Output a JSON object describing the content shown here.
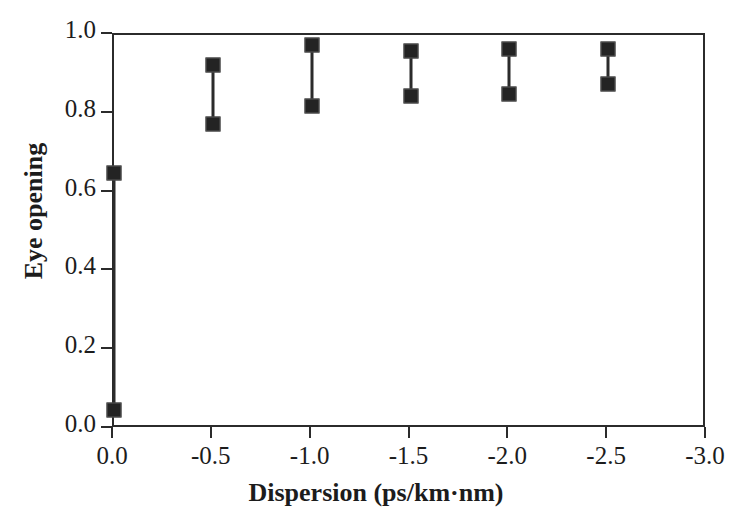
{
  "chart_data": {
    "type": "scatter",
    "title": "",
    "xlabel": "Dispersion (ps/km·nm)",
    "ylabel": "Eye opening",
    "xlim": [
      0.0,
      -3.0
    ],
    "ylim": [
      0.0,
      1.0
    ],
    "xticks": [
      "0.0",
      "-0.5",
      "-1.0",
      "-1.5",
      "-2.0",
      "-2.5",
      "-3.0"
    ],
    "xtick_values": [
      0.0,
      -0.5,
      -1.0,
      -1.5,
      -2.0,
      -2.5,
      -3.0
    ],
    "yticks": [
      "0.0",
      "0.2",
      "0.4",
      "0.6",
      "0.8",
      "1.0"
    ],
    "ytick_values": [
      0.0,
      0.2,
      0.4,
      0.6,
      0.8,
      1.0
    ],
    "grid": false,
    "legend": null,
    "marker": "filled-square",
    "series": [
      {
        "name": "Eye opening range",
        "x": [
          0.0,
          -0.5,
          -1.0,
          -1.5,
          -2.0,
          -2.5
        ],
        "upper": [
          0.65,
          0.925,
          0.975,
          0.96,
          0.965,
          0.965
        ],
        "lower": [
          0.048,
          0.775,
          0.82,
          0.845,
          0.85,
          0.875
        ]
      }
    ],
    "points": [
      {
        "x": 0.0,
        "upper": 0.65,
        "lower": 0.048
      },
      {
        "x": -0.5,
        "upper": 0.925,
        "lower": 0.775
      },
      {
        "x": -1.0,
        "upper": 0.975,
        "lower": 0.82
      },
      {
        "x": -1.5,
        "upper": 0.96,
        "lower": 0.845
      },
      {
        "x": -2.0,
        "upper": 0.965,
        "lower": 0.85
      },
      {
        "x": -2.5,
        "upper": 0.965,
        "lower": 0.875
      }
    ],
    "colors": {
      "marker": "#232323",
      "line": "#2b2b2b",
      "axis": "#2b2b2b",
      "text": "#1c1c1c",
      "background": "#ffffff"
    }
  }
}
